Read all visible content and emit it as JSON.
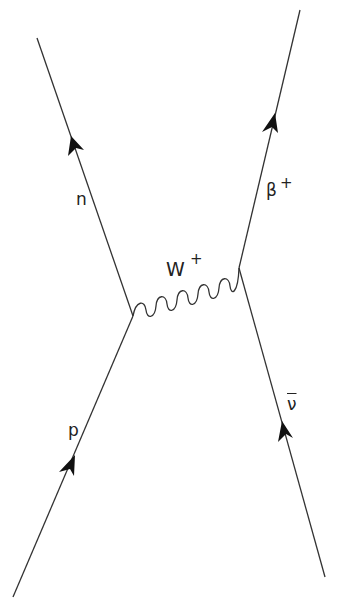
{
  "diagram": {
    "type": "Feynman diagram (beta-plus decay)",
    "colors": {
      "line": "#333333",
      "background": "#ffffff"
    },
    "particles": {
      "neutron": {
        "label": "n"
      },
      "positron": {
        "label": "β",
        "superscript": "+"
      },
      "w_boson": {
        "label": "W",
        "superscript": "+"
      },
      "proton": {
        "label": "p"
      },
      "antineutrino": {
        "label": "ν",
        "overbar": true
      }
    }
  }
}
